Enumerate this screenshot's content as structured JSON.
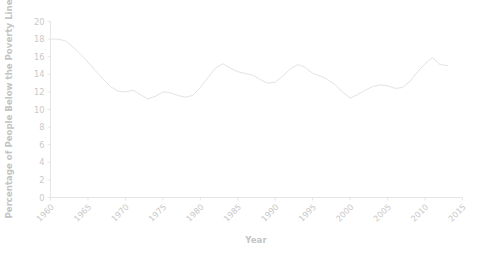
{
  "chart_data": {
    "type": "line",
    "title": "",
    "xlabel": "Year",
    "ylabel": "Percentage of People Below the Poverty Line",
    "xlim": [
      1960,
      2015
    ],
    "ylim": [
      0,
      20
    ],
    "grid": false,
    "legend": null,
    "xticks": [
      "1960",
      "1965",
      "1970",
      "1975",
      "1980",
      "1985",
      "1990",
      "1995",
      "2000",
      "2005",
      "2010",
      "2015"
    ],
    "yticks": [
      "0",
      "2",
      "4",
      "6",
      "8",
      "10",
      "12",
      "14",
      "16",
      "18",
      "20"
    ],
    "line_color": "#e3e3e3",
    "x": [
      1960,
      1961,
      1962,
      1963,
      1964,
      1965,
      1966,
      1967,
      1968,
      1969,
      1970,
      1971,
      1972,
      1973,
      1974,
      1975,
      1976,
      1977,
      1978,
      1979,
      1980,
      1981,
      1982,
      1983,
      1984,
      1985,
      1986,
      1987,
      1988,
      1989,
      1990,
      1991,
      1992,
      1993,
      1994,
      1995,
      1996,
      1997,
      1998,
      1999,
      2000,
      2001,
      2002,
      2003,
      2004,
      2005,
      2006,
      2007,
      2008,
      2009,
      2010,
      2011,
      2012,
      2013
    ],
    "values": [
      18.0,
      18.0,
      17.8,
      17.1,
      16.3,
      15.4,
      14.4,
      13.5,
      12.6,
      12.1,
      12.0,
      12.2,
      11.7,
      11.2,
      11.5,
      12.0,
      11.9,
      11.6,
      11.4,
      11.6,
      12.5,
      13.6,
      14.7,
      15.2,
      14.7,
      14.3,
      14.1,
      13.9,
      13.4,
      13.0,
      13.1,
      13.8,
      14.6,
      15.1,
      14.8,
      14.1,
      13.8,
      13.4,
      12.8,
      12.0,
      11.3,
      11.7,
      12.2,
      12.6,
      12.8,
      12.7,
      12.4,
      12.5,
      13.2,
      14.3,
      15.2,
      15.9,
      15.1,
      15.0
    ],
    "annotations": {
      "bottom_caption_cropped": ""
    }
  },
  "axes": {
    "x_axis_label": "Year",
    "y_axis_label": "Percentage of People Below the Poverty Line"
  }
}
